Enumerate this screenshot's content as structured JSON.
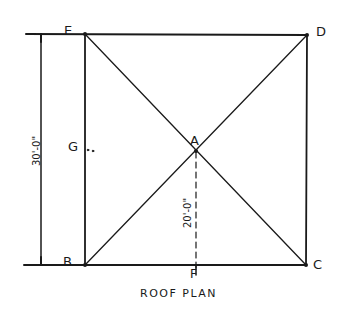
{
  "diagram": {
    "title": "ROOF PLAN",
    "points": {
      "A": "A",
      "B": "B",
      "C": "C",
      "D": "D",
      "E": "E",
      "F": "F",
      "G": "G"
    },
    "dimensions": {
      "overall_depth": "30'-0\"",
      "ridge_to_eave": "20'-0\""
    },
    "line_color": "#1a1a1a",
    "background": "#ffffff"
  }
}
